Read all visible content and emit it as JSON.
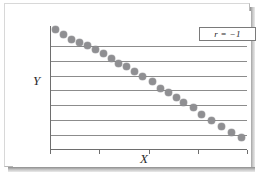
{
  "figure": {
    "frame_style": "beveled-border-with-drop-shadow",
    "background_color": "#ffffff",
    "border_color": "#c4c4c4",
    "shadow_color": "#8d8d8d"
  },
  "legend": {
    "label": "r = −1",
    "position": "top-right",
    "border_color": "#7a7a7a"
  },
  "axes": {
    "x_label": "X",
    "y_label": "Y",
    "axis_color": "#6e6e6e",
    "gridline_color": "#8c8c8c",
    "gridline_count": 7,
    "x_tick_count": 5
  },
  "marker": {
    "color": "#8f8f92",
    "shape": "circle",
    "size_px": 7
  },
  "chart_data": {
    "type": "scatter",
    "title": "",
    "subtitle": "",
    "xlabel": "X",
    "ylabel": "Y",
    "xlim": [
      0,
      100
    ],
    "ylim": [
      0,
      100
    ],
    "grid": true,
    "legend": [
      "r = −1"
    ],
    "annotations": [
      {
        "text": "r = −1",
        "position": "top-right",
        "meaning": "perfect negative correlation"
      }
    ],
    "xticks": [
      0,
      25,
      50,
      75,
      100
    ],
    "xticklabels": [
      "",
      "",
      "",
      "",
      ""
    ],
    "yticks": [
      12,
      24,
      36,
      48,
      60,
      72,
      84
    ],
    "yticklabels": [
      "",
      "",
      "",
      "",
      "",
      "",
      ""
    ],
    "series": [
      {
        "name": "r = −1",
        "marker": "circle",
        "color": "#8f8f92",
        "x": [
          3,
          7,
          11,
          15,
          19,
          23,
          27,
          31,
          35,
          39,
          43,
          47,
          52,
          56,
          60,
          64,
          68,
          73,
          77,
          82,
          87,
          92,
          97
        ],
        "y": [
          97,
          93,
          89,
          87,
          84,
          81,
          78,
          74,
          70,
          67,
          63,
          59,
          55,
          50,
          46,
          42,
          38,
          34,
          29,
          24,
          19,
          14,
          10
        ]
      }
    ]
  }
}
